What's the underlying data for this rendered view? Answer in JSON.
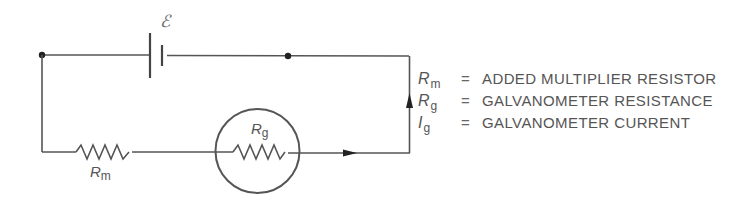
{
  "diagram": {
    "components": {
      "battery": {
        "label": "ℰ",
        "name": "EMF source"
      },
      "multiplier_resistor": {
        "symbol": "R",
        "subscript": "m"
      },
      "galvanometer": {
        "symbol": "R",
        "subscript": "g"
      }
    },
    "current_direction": "clockwise through galvanometer then up right side",
    "colors": {
      "wire": "#555555",
      "text": "#555555",
      "node": "#222222"
    }
  },
  "legend": [
    {
      "symbol": "R",
      "subscript": "m",
      "equals": "=",
      "description": "ADDED MULTIPLIER RESISTOR"
    },
    {
      "symbol": "R",
      "subscript": "g",
      "equals": "=",
      "description": "GALVANOMETER RESISTANCE"
    },
    {
      "symbol": "I",
      "subscript": "g",
      "equals": "=",
      "description": "GALVANOMETER CURRENT"
    }
  ]
}
